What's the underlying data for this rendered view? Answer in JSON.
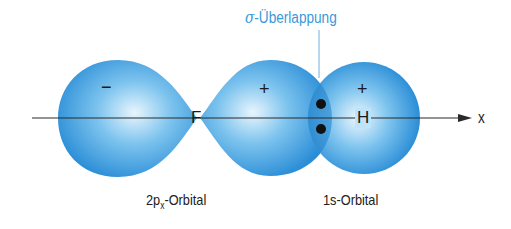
{
  "title": {
    "sigma": "σ",
    "text": "-Überlappung"
  },
  "axis": {
    "label": "x"
  },
  "atoms": {
    "left": "F",
    "right": "H"
  },
  "signs": {
    "p_left": "−",
    "p_right": "+",
    "s": "+"
  },
  "labels": {
    "p_orbital_main": "2p",
    "p_orbital_sub": "x",
    "p_orbital_suffix": "-Orbital",
    "s_orbital": "1s-Orbital"
  },
  "colors": {
    "lobe_light": "#e6f4fd",
    "lobe_mid": "#5ab3ea",
    "lobe_dark": "#1e86d4",
    "accent": "#3a9ad9"
  }
}
